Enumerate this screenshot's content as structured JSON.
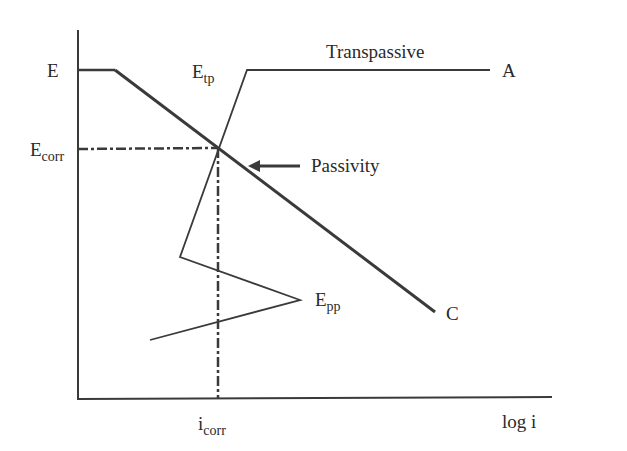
{
  "diagram": {
    "type": "polarization-curve",
    "colors": {
      "line": "#3a3a3a",
      "background": "#ffffff"
    },
    "axes": {
      "y_axis_label_top": "E",
      "x_axis_label": "log i"
    },
    "labels": {
      "E": "E",
      "E_corr_main": "E",
      "E_corr_sub": "corr",
      "E_tp_main": "E",
      "E_tp_sub": "tp",
      "E_pp_main": "E",
      "E_pp_sub": "pp",
      "i_corr_main": "i",
      "i_corr_sub": "corr",
      "transpassive": "Transpassive",
      "passivity": "Passivity",
      "A": "A",
      "C": "C",
      "log_i": "log i"
    },
    "curves": {
      "cathodic": {
        "from": [
          115,
          70
        ],
        "to": [
          435,
          312
        ],
        "label": "C"
      },
      "anodic": {
        "points": [
          [
            150,
            340
          ],
          [
            300,
            300
          ],
          [
            180,
            257
          ],
          [
            247,
            70
          ],
          [
            490,
            70
          ]
        ],
        "label": "A"
      },
      "corrosion_point": [
        217,
        148
      ]
    }
  }
}
